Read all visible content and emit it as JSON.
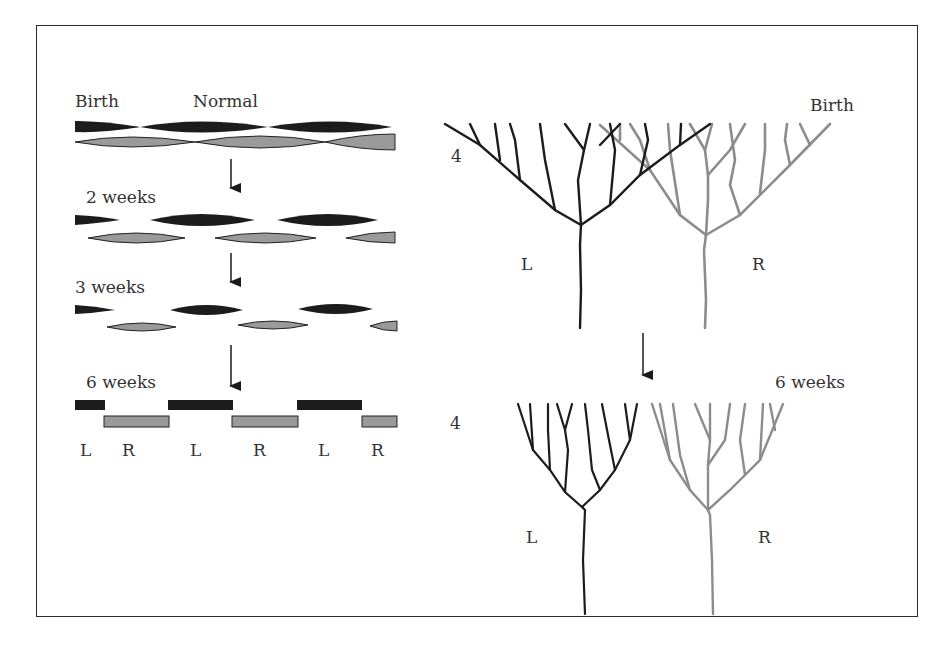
{
  "figure": {
    "left_panel": {
      "title_birth": "Birth",
      "title_normal": "Normal",
      "stages": [
        {
          "label": "2 weeks"
        },
        {
          "label": "3 weeks"
        },
        {
          "label": "6 weeks"
        }
      ],
      "column_labels": [
        "L",
        "R",
        "L",
        "R",
        "L",
        "R"
      ]
    },
    "right_panel": {
      "top": {
        "stage": "Birth",
        "layer": "4",
        "left_tree": "L",
        "right_tree": "R"
      },
      "bottom": {
        "stage": "6 weeks",
        "layer": "4",
        "left_tree": "L",
        "right_tree": "R"
      }
    },
    "colors": {
      "left_eye": "#1c1c1c",
      "right_eye": "#8c8c8c",
      "right_eye_fill": "#9a9a9a"
    }
  }
}
